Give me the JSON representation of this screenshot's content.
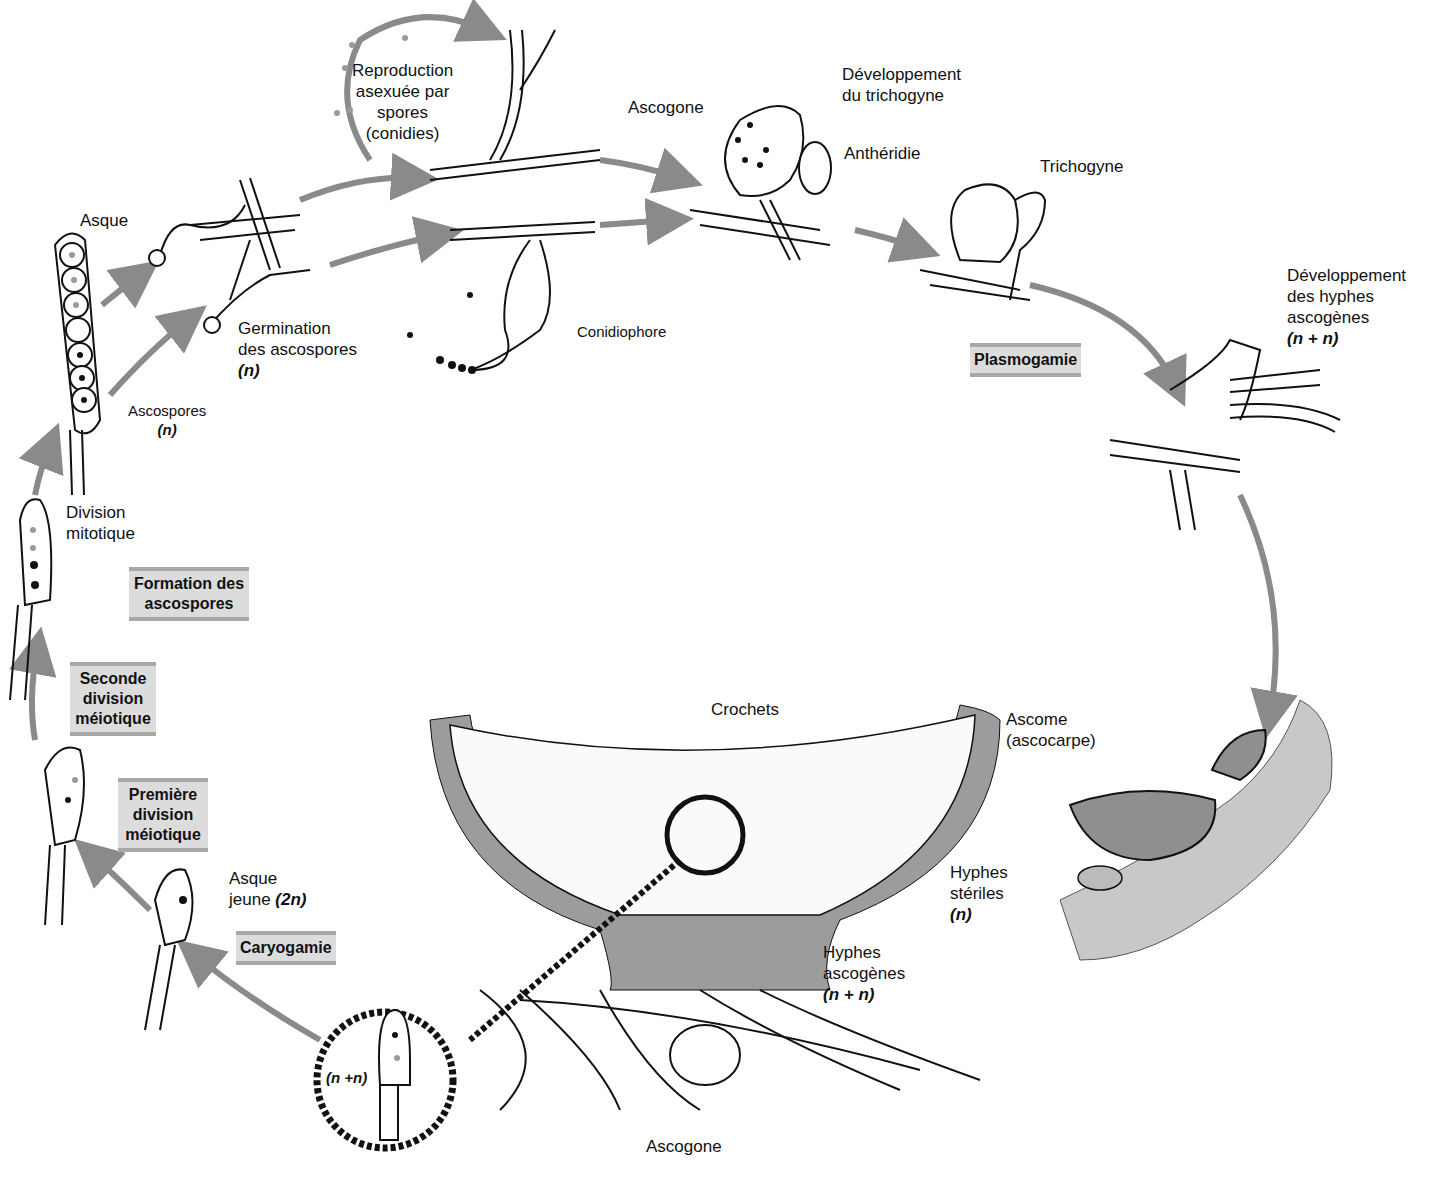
{
  "diagram": {
    "colors": {
      "arrow": "#8a8a8a",
      "stage_bg": "#dcdcdc",
      "stage_border": "#a8a8a8",
      "ascocarp_fill": "#8f8f8f",
      "substrate": "#c8c8c8",
      "nucleus_dark": "#111111",
      "nucleus_light": "#9a9a9a"
    },
    "labels": {
      "reproduction_asexuee": [
        "Reproduction",
        "asexuée par",
        "spores",
        "(conidies)"
      ],
      "ascogone_top": "Ascogone",
      "developpement_trichogyne": [
        "Développement",
        "du trichogyne"
      ],
      "antheridie": "Anthéridie",
      "trichogyne": "Trichogyne",
      "developpement_hyphes": [
        "Développement",
        "des hyphes",
        "ascogènes"
      ],
      "developpement_hyphes_ploidy": "(n + n)",
      "asque_top": "Asque",
      "germination": [
        "Germination",
        "des ascospores"
      ],
      "germination_ploidy": "(n)",
      "ascospores": "Ascospores",
      "ascospores_ploidy": "(n)",
      "conidiophore": "Conidiophore",
      "division_mitotique": [
        "Division",
        "mitotique"
      ],
      "asque_jeune": [
        "Asque",
        "jeune"
      ],
      "asque_jeune_ploidy": "(2n)",
      "crochets": "Crochets",
      "ascome": [
        "Ascome",
        "(ascocarpe)"
      ],
      "hyphes_steriles": [
        "Hyphes",
        "stériles"
      ],
      "hyphes_steriles_ploidy": "(n)",
      "hyphes_ascogenes": [
        "Hyphes",
        "ascogènes"
      ],
      "hyphes_ascogenes_ploidy": "(n + n)",
      "ascogone_bottom": "Ascogone",
      "inset_ploidy": "(n +n)"
    },
    "stages": {
      "plasmogamie": [
        "Plasmogamie"
      ],
      "formation_ascospores": [
        "Formation des",
        "ascospores"
      ],
      "seconde_division": [
        "Seconde",
        "division",
        "méiotique"
      ],
      "premiere_division": [
        "Première",
        "division",
        "méiotique"
      ],
      "caryogamie": [
        "Caryogamie"
      ]
    }
  }
}
